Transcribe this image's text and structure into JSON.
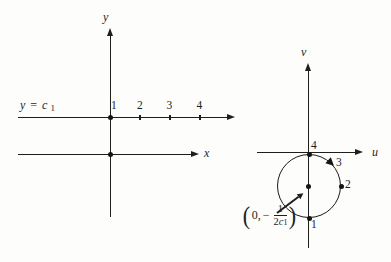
{
  "colors": {
    "ink": "#1e1e1e",
    "paper": "#fdfdfb"
  },
  "left_plot": {
    "y_axis_label": "y",
    "x_axis_label": "x",
    "line_equation": {
      "lhs": "y",
      "equals": "=",
      "rhs_var": "c",
      "rhs_sub": "1"
    },
    "tick_labels": [
      "1",
      "2",
      "3",
      "4"
    ]
  },
  "right_plot": {
    "v_axis_label": "v",
    "u_axis_label": "u",
    "circle_point_labels": {
      "p4": "4",
      "p3": "3",
      "p2": "2",
      "p1": "1"
    },
    "center_coordinate": {
      "open_paren": "(",
      "u_value": "0,",
      "minus": "−",
      "fraction_numerator": "1",
      "fraction_denominator_coeff": "2",
      "fraction_denominator_var": "c",
      "fraction_denominator_sub": "1",
      "close_paren": ")"
    }
  }
}
